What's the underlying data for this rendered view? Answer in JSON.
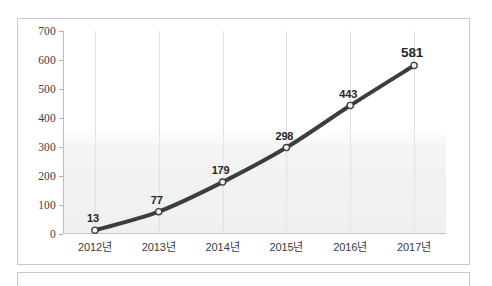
{
  "chart_data": {
    "type": "line",
    "title": "",
    "subtitle": "",
    "xlabel": "",
    "ylabel": "",
    "categories": [
      "2012년",
      "2013년",
      "2014년",
      "2015년",
      "2016년",
      "2017년"
    ],
    "values": [
      13,
      77,
      179,
      298,
      443,
      581
    ],
    "series": [
      {
        "name": "",
        "values": [
          13,
          77,
          179,
          298,
          443,
          581
        ]
      }
    ],
    "data_labels": [
      "13",
      "77",
      "179",
      "298",
      "443",
      "581"
    ],
    "ylim": [
      0,
      700
    ],
    "yticks": [
      0,
      100,
      200,
      300,
      400,
      500,
      600,
      700
    ],
    "ytick_labels": [
      "0",
      "100",
      "200",
      "300",
      "400",
      "500",
      "600",
      "700"
    ],
    "grid": {
      "vertical": true,
      "horizontal": false
    },
    "legend": {
      "visible": false,
      "position": "none"
    },
    "markers": {
      "shape": "circle",
      "fill": "#f2f2f2",
      "stroke": "#3d3d3d"
    },
    "colors": {
      "line": "#3d3d3d",
      "axis": "#bdbdbd",
      "gridline": "#e3e3e3",
      "label_text": "#262626",
      "tick_text": "#3c3c3c",
      "frame_border": "#c9c9c9",
      "plot_background": "#f1f1f1",
      "canvas_background": "#ffffff"
    },
    "line_width": 4,
    "smooth": true,
    "emphasized_label": "581"
  }
}
